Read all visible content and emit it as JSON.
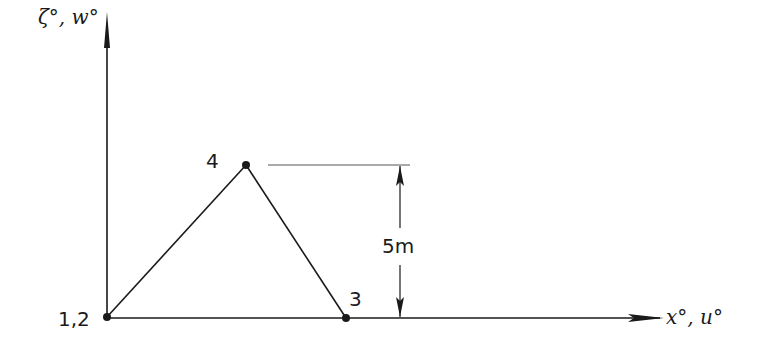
{
  "diagram": {
    "type": "truss-geometry",
    "colors": {
      "ink": "#1a1a1a",
      "guide": "#555555",
      "background": "#ffffff"
    },
    "axes": {
      "vertical_label": "ζ°, w°",
      "horizontal_label": "x°, u°"
    },
    "nodes": [
      {
        "id": "n12",
        "label": "1,2",
        "x": 107,
        "y": 317
      },
      {
        "id": "n4",
        "label": "4",
        "x": 246,
        "y": 165
      },
      {
        "id": "n3",
        "label": "3",
        "x": 346,
        "y": 318
      }
    ],
    "members": [
      {
        "from": "n12",
        "to": "n4"
      },
      {
        "from": "n4",
        "to": "n3"
      }
    ],
    "dimension": {
      "label": "5m",
      "value": 5,
      "unit": "m"
    }
  }
}
